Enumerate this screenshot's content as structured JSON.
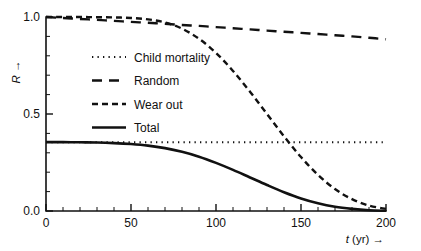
{
  "figure": {
    "width": 421,
    "height": 251,
    "background": "#ffffff",
    "ink_color": "#111111"
  },
  "chart_data": {
    "type": "line",
    "title": "",
    "subtitle": "",
    "xlabel": "t (yr) →",
    "xlabel_italic_part": "t",
    "xlabel_rest": " (yr) →",
    "ylabel": "R →",
    "ylabel_italic_part": "R",
    "ylabel_rest": " →",
    "xlim": [
      0,
      200
    ],
    "ylim": [
      0.0,
      1.0
    ],
    "grid": false,
    "legend_position": "upper-left-inside",
    "x_ticks": [
      0,
      50,
      100,
      150,
      200
    ],
    "x_tick_labels": [
      "0",
      "50",
      "100",
      "150",
      "200"
    ],
    "x_minor_step": 10,
    "y_ticks": [
      0.0,
      0.5,
      1.0
    ],
    "y_tick_labels": [
      "0.0",
      "0.5",
      "1.0"
    ],
    "y_minor_step": 0.1,
    "x": [
      0,
      10,
      20,
      30,
      40,
      50,
      60,
      70,
      80,
      90,
      100,
      110,
      120,
      130,
      140,
      150,
      160,
      170,
      180,
      190,
      200
    ],
    "series": [
      {
        "name": "Child mortality",
        "style": "dotted",
        "stroke_width": 2.0,
        "dash": "1.3 4.2",
        "values": [
          0.355,
          0.355,
          0.355,
          0.355,
          0.355,
          0.355,
          0.355,
          0.355,
          0.355,
          0.355,
          0.355,
          0.355,
          0.355,
          0.355,
          0.355,
          0.355,
          0.355,
          0.355,
          0.355,
          0.355,
          0.355
        ]
      },
      {
        "name": "Random",
        "style": "long-dash",
        "stroke_width": 2.4,
        "dash": "10 7",
        "values": [
          1.0,
          0.995,
          0.99,
          0.985,
          0.98,
          0.975,
          0.97,
          0.965,
          0.959,
          0.954,
          0.948,
          0.942,
          0.936,
          0.93,
          0.924,
          0.918,
          0.912,
          0.906,
          0.9,
          0.893,
          0.885
        ]
      },
      {
        "name": "Wear out",
        "style": "short-dash",
        "stroke_width": 2.4,
        "dash": "6 4",
        "values": [
          1.0,
          1.0,
          1.0,
          0.999,
          0.998,
          0.995,
          0.988,
          0.972,
          0.94,
          0.888,
          0.815,
          0.722,
          0.615,
          0.5,
          0.385,
          0.278,
          0.186,
          0.113,
          0.061,
          0.028,
          0.011
        ]
      },
      {
        "name": "Total",
        "style": "solid",
        "stroke_width": 2.6,
        "dash": "",
        "values": [
          0.355,
          0.355,
          0.354,
          0.353,
          0.35,
          0.345,
          0.337,
          0.324,
          0.305,
          0.28,
          0.248,
          0.212,
          0.173,
          0.134,
          0.097,
          0.065,
          0.04,
          0.022,
          0.011,
          0.004,
          0.001
        ]
      }
    ],
    "legend_entries": [
      {
        "label": "Child mortality",
        "style": "dotted"
      },
      {
        "label": "Random",
        "style": "long-dash"
      },
      {
        "label": "Wear out",
        "style": "short-dash"
      },
      {
        "label": "Total",
        "style": "solid"
      }
    ]
  }
}
